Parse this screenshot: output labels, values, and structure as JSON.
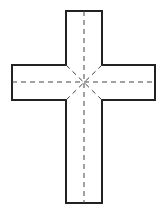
{
  "diagram": {
    "title": "",
    "shape": "cross-net",
    "colors": {
      "background": "#ffffff",
      "outline": "#222222",
      "fold_lines": "#444444"
    },
    "outline_points": "66,11 102,11 102,65 155,65 155,100 102,100 102,203 66,203 66,100 12,100 12,65 66,65",
    "fold_lines": [
      {
        "x1": 84,
        "y1": 11,
        "x2": 84,
        "y2": 203
      },
      {
        "x1": 12,
        "y1": 82,
        "x2": 155,
        "y2": 82
      },
      {
        "x1": 66,
        "y1": 65,
        "x2": 102,
        "y2": 100
      },
      {
        "x1": 102,
        "y1": 65,
        "x2": 66,
        "y2": 100
      }
    ]
  }
}
